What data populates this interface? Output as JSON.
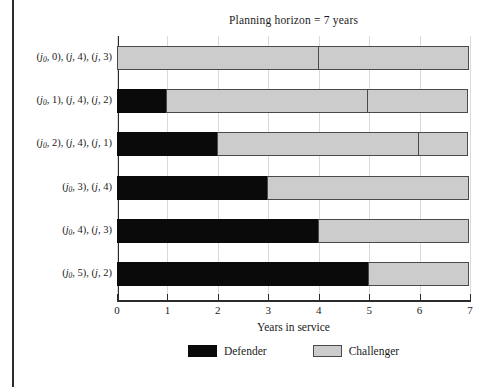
{
  "figure": {
    "left_rule": true,
    "background": "#ffffff"
  },
  "chart_data": {
    "type": "bar",
    "orientation": "horizontal",
    "stacked": true,
    "title": "Planning horizon = 7 years",
    "xlabel": "Years in service",
    "ylabel": "",
    "xlim": [
      0,
      7
    ],
    "xticks": [
      0,
      1,
      2,
      3,
      4,
      5,
      6,
      7
    ],
    "xticklabels": [
      "0",
      "1",
      "2",
      "3",
      "4",
      "5",
      "6",
      "7"
    ],
    "grid": true,
    "grid_axis": "x",
    "legend_position": "bottom",
    "colors": {
      "defender": "#0a0a0a",
      "challenger": "#cccccc",
      "edge": "#3a3a3a",
      "gridline": "#d9d9d9",
      "axis": "#2b2b2b"
    },
    "legend": [
      {
        "name": "Defender",
        "color": "#0a0a0a"
      },
      {
        "name": "Challenger",
        "color": "#cccccc"
      }
    ],
    "categories": [
      "(j0, 0), (j, 4), (j, 3)",
      "(j0, 1), (j, 4), (j, 2)",
      "(j0, 2), (j, 4), (j, 1)",
      "(j0, 3), (j, 4)",
      "(j0, 4), (j, 3)",
      "(j0, 5), (j, 2)"
    ],
    "rows": [
      {
        "label_plain": "(j0, 0), (j, 4), (j, 3)",
        "segments": [
          {
            "series": "Challenger",
            "start": 0,
            "end": 4,
            "length": 4
          },
          {
            "series": "Challenger",
            "start": 4,
            "end": 7,
            "length": 3
          }
        ]
      },
      {
        "label_plain": "(j0, 1), (j, 4), (j, 2)",
        "segments": [
          {
            "series": "Defender",
            "start": 0,
            "end": 1,
            "length": 1
          },
          {
            "series": "Challenger",
            "start": 1,
            "end": 5,
            "length": 4
          },
          {
            "series": "Challenger",
            "start": 5,
            "end": 7,
            "length": 2
          }
        ]
      },
      {
        "label_plain": "(j0, 2), (j, 4), (j, 1)",
        "segments": [
          {
            "series": "Defender",
            "start": 0,
            "end": 2,
            "length": 2
          },
          {
            "series": "Challenger",
            "start": 2,
            "end": 6,
            "length": 4
          },
          {
            "series": "Challenger",
            "start": 6,
            "end": 7,
            "length": 1
          }
        ]
      },
      {
        "label_plain": "(j0, 3), (j, 4)",
        "segments": [
          {
            "series": "Defender",
            "start": 0,
            "end": 3,
            "length": 3
          },
          {
            "series": "Challenger",
            "start": 3,
            "end": 7,
            "length": 4
          }
        ]
      },
      {
        "label_plain": "(j0, 4), (j, 3)",
        "segments": [
          {
            "series": "Defender",
            "start": 0,
            "end": 4,
            "length": 4
          },
          {
            "series": "Challenger",
            "start": 4,
            "end": 7,
            "length": 3
          }
        ]
      },
      {
        "label_plain": "(j0, 5), (j, 2)",
        "segments": [
          {
            "series": "Defender",
            "start": 0,
            "end": 5,
            "length": 5
          },
          {
            "series": "Challenger",
            "start": 5,
            "end": 7,
            "length": 2
          }
        ]
      }
    ]
  }
}
